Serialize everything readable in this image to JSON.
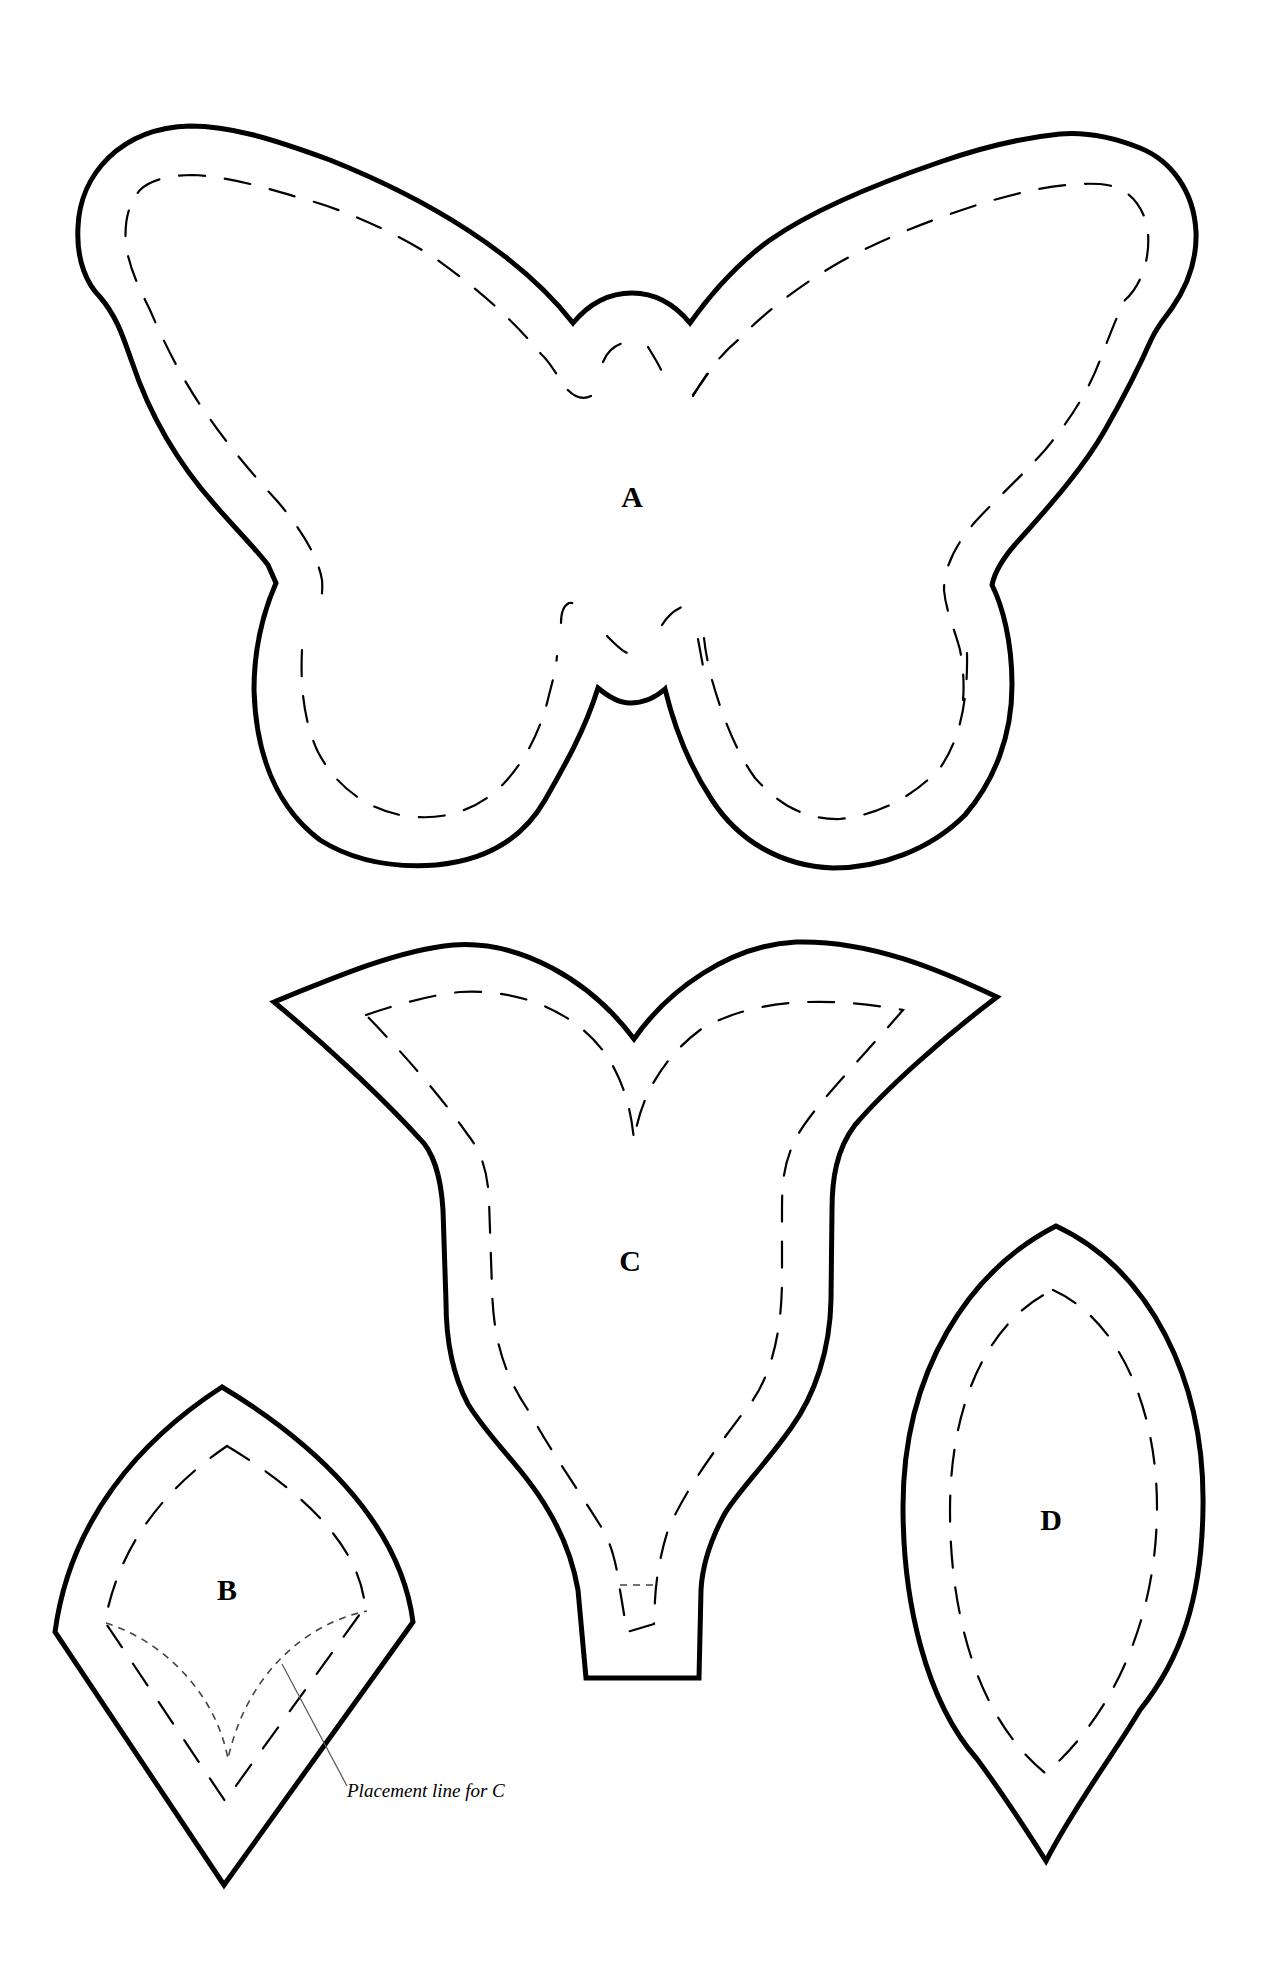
{
  "document": {
    "type": "sewing pattern template sheet",
    "background": "#ffffff",
    "line_color": "#000000"
  },
  "pieces": [
    {
      "id": "A",
      "label": "A",
      "shape": "butterfly",
      "has_seam_line": true
    },
    {
      "id": "B",
      "label": "B",
      "shape": "pointed diamond leaf",
      "has_seam_line": true,
      "has_placement_line": true
    },
    {
      "id": "C",
      "label": "C",
      "shape": "tulip flower",
      "has_seam_line": true
    },
    {
      "id": "D",
      "label": "D",
      "shape": "pointed oval leaf",
      "has_seam_line": true
    }
  ],
  "annotations": {
    "placement_note": "Placement line for C"
  }
}
